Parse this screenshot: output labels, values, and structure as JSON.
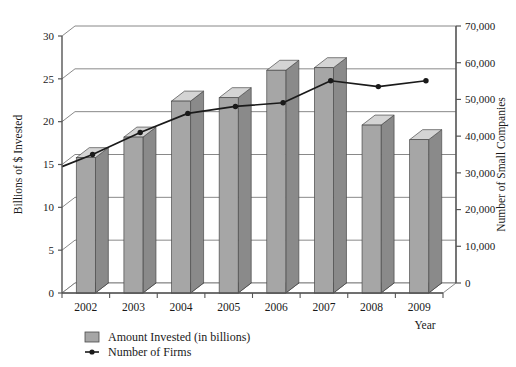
{
  "chart_data": {
    "type": "bar",
    "title": "",
    "subtitle": "",
    "xlabel": "Year",
    "ylabel": "Billions of $ Invested",
    "y2label": "Number of Small Companies",
    "categories": [
      "2002",
      "2003",
      "2004",
      "2005",
      "2006",
      "2007",
      "2008",
      "2009"
    ],
    "grid": true,
    "legend_position": "bottom-left",
    "ylim": [
      0,
      30
    ],
    "yticks": [
      0,
      5,
      10,
      15,
      20,
      25,
      30
    ],
    "ytick_labels": [
      "0",
      "5",
      "10",
      "15",
      "20",
      "25",
      "30"
    ],
    "y2lim": [
      0,
      70000
    ],
    "y2ticks": [
      0,
      10000,
      20000,
      30000,
      40000,
      50000,
      60000,
      70000
    ],
    "y2tick_labels": [
      "0",
      "10,000",
      "20,000",
      "30,000",
      "40,000",
      "50,000",
      "60,000",
      "70,000"
    ],
    "series": [
      {
        "name": "Amount Invested (in billions)",
        "type": "bar",
        "axis": "left",
        "color": "#a6a6a6",
        "values": [
          15.8,
          18.2,
          22.4,
          22.8,
          26.0,
          26.3,
          19.6,
          17.9
        ]
      },
      {
        "name": "Number of Firms",
        "type": "line",
        "axis": "right",
        "color": "#1a1a1a",
        "values": [
          36300,
          42300,
          47500,
          49400,
          50400,
          56400,
          54800,
          56400
        ]
      }
    ]
  },
  "legend": {
    "items": [
      {
        "label": "Amount Invested (in billions)",
        "marker": "swatch-gray"
      },
      {
        "label": "Number of Firms",
        "marker": "line-with-dot"
      }
    ]
  },
  "colors": {
    "bar_front": "#a6a6a6",
    "bar_top": "#d4d4d4",
    "bar_side": "#8a8a8a",
    "line": "#1a1a1a",
    "axis": "#555555",
    "grid": "#6b6b6b",
    "floor": "#111111",
    "text": "#1a1a1a",
    "background": "#ffffff"
  }
}
